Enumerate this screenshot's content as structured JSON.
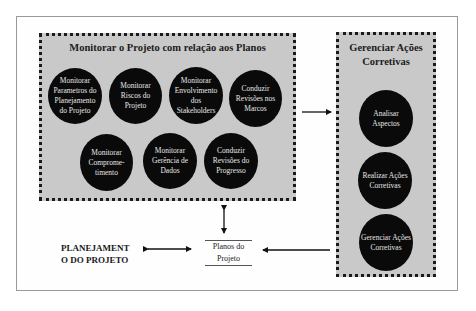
{
  "diagram": {
    "monitor_group": {
      "title": "Monitorar o Projeto com relação aos Planos",
      "processes": [
        {
          "label": "Monitorar Parametros do Planejamento do Projeto"
        },
        {
          "label": "Monitorar Riscos do Projeto"
        },
        {
          "label": "Monitorar Envolvimento dos Stakeholders"
        },
        {
          "label": "Conduzir Revisões nos Marcos"
        },
        {
          "label": "Monitorar Comprome-timento"
        },
        {
          "label": "Monitorar Gerência de Dados"
        },
        {
          "label": "Conduzir Revisões do Progresso"
        }
      ]
    },
    "corrective_group": {
      "title": "Gerenciar Ações Corretivas",
      "processes": [
        {
          "label": "Analisar Aspectos"
        },
        {
          "label": "Realizar Ações Corretivas"
        },
        {
          "label": "Gerenciar Ações Corretivas"
        }
      ]
    },
    "planning_label": "PLANEJAMENTO DO PROJETO",
    "planning_line1": "PLANEJAMENT",
    "planning_line2": "O DO PROJETO",
    "plans_store": {
      "line1": "Planos do",
      "line2": "Projeto"
    },
    "colors": {
      "group_fill": "#c9c9c9",
      "circle_fill": "#0a0a0a",
      "circle_text": "#e8e8e8",
      "border": "#1a1a1a"
    }
  }
}
